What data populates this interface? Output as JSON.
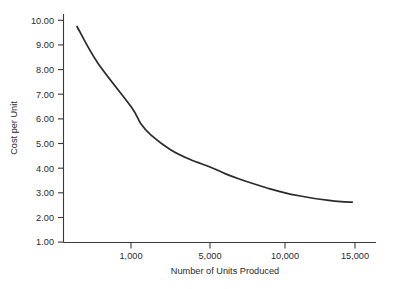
{
  "chart_data": {
    "type": "line",
    "title": "",
    "subtitle": "",
    "xlabel": "Number of Units Produced",
    "ylabel": "Cost per Unit",
    "grid": false,
    "legend": null,
    "legend_position": "none",
    "line_color": "#2a2a2a",
    "axis_color": "#3a3a3a",
    "background_color": "#ffffff",
    "xlim": [
      0,
      16500
    ],
    "ylim": [
      1.0,
      10.0
    ],
    "x_tick_values": [
      1000,
      5000,
      10000,
      15000
    ],
    "x_tick_labels": [
      "1,000",
      "5,000",
      "10,000",
      "15,000"
    ],
    "y_tick_values": [
      1.0,
      2.0,
      3.0,
      4.0,
      5.0,
      6.0,
      7.0,
      8.0,
      9.0,
      10.0
    ],
    "y_tick_labels": [
      "1.00",
      "2.00",
      "3.00",
      "4.00",
      "5.00",
      "6.00",
      "7.00",
      "8.00",
      "9.00",
      "10.00"
    ],
    "series": [
      {
        "name": "Cost per Unit",
        "x": [
          200,
          500,
          1000,
          1500,
          2000,
          3000,
          4000,
          5000,
          6000,
          7000,
          8000,
          9000,
          10000,
          11000,
          12000,
          13000,
          14000,
          14800
        ],
        "values": [
          9.75,
          8.3,
          6.5,
          5.8,
          5.35,
          4.75,
          4.35,
          4.05,
          3.78,
          3.55,
          3.35,
          3.16,
          3.0,
          2.88,
          2.78,
          2.7,
          2.64,
          2.62
        ]
      }
    ],
    "annotations": []
  }
}
